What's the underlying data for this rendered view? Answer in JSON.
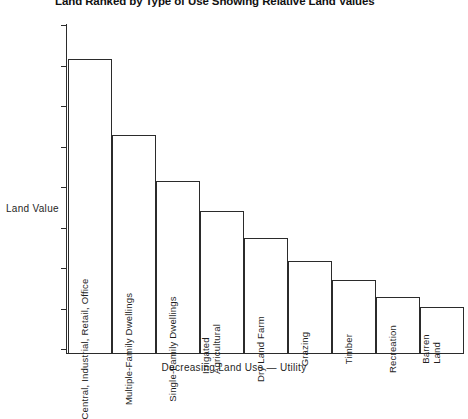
{
  "chart_data": {
    "type": "bar",
    "title": "Land Ranked by Type of Use Showing Relative Land Values",
    "xlabel": "Decreasing Land Use — Utility",
    "ylabel": "Land Value",
    "grid": false,
    "legend": "none",
    "ylim": [
      0,
      100
    ],
    "axis_ticks_unlabeled": true,
    "categories": [
      "Central, Industrial, Retail, Office",
      "Multiple-Family Dwellings",
      "Single-Family Dwellings",
      "Irrigated\nAgricultural",
      "Dry Land Farm",
      "Grazing",
      "Timber",
      "Recreation",
      "Barren\nLand"
    ],
    "values": [
      89,
      66,
      52,
      43,
      35,
      28,
      22,
      17,
      14
    ]
  },
  "chart": {
    "title": "Land Ranked by Type of Use Showing Relative Land Values",
    "y_axis_title": "Land Value",
    "x_axis_title": "Decreasing Land Use — Utility",
    "bars": [
      {
        "label": "Central, Industrial, Retail, Office",
        "value": 89
      },
      {
        "label": "Multiple-Family Dwellings",
        "value": 66
      },
      {
        "label": "Single-Family Dwellings",
        "value": 52
      },
      {
        "label": "Irrigated\nAgricultural",
        "value": 43
      },
      {
        "label": "Dry Land Farm",
        "value": 35
      },
      {
        "label": "Grazing",
        "value": 28
      },
      {
        "label": "Timber",
        "value": 22
      },
      {
        "label": "Recreation",
        "value": 17
      },
      {
        "label": "Barren\nLand",
        "value": 14
      }
    ],
    "colors": {
      "ink": "#2b2b2b",
      "text": "#1f1f1f",
      "background": "#ffffff"
    }
  }
}
